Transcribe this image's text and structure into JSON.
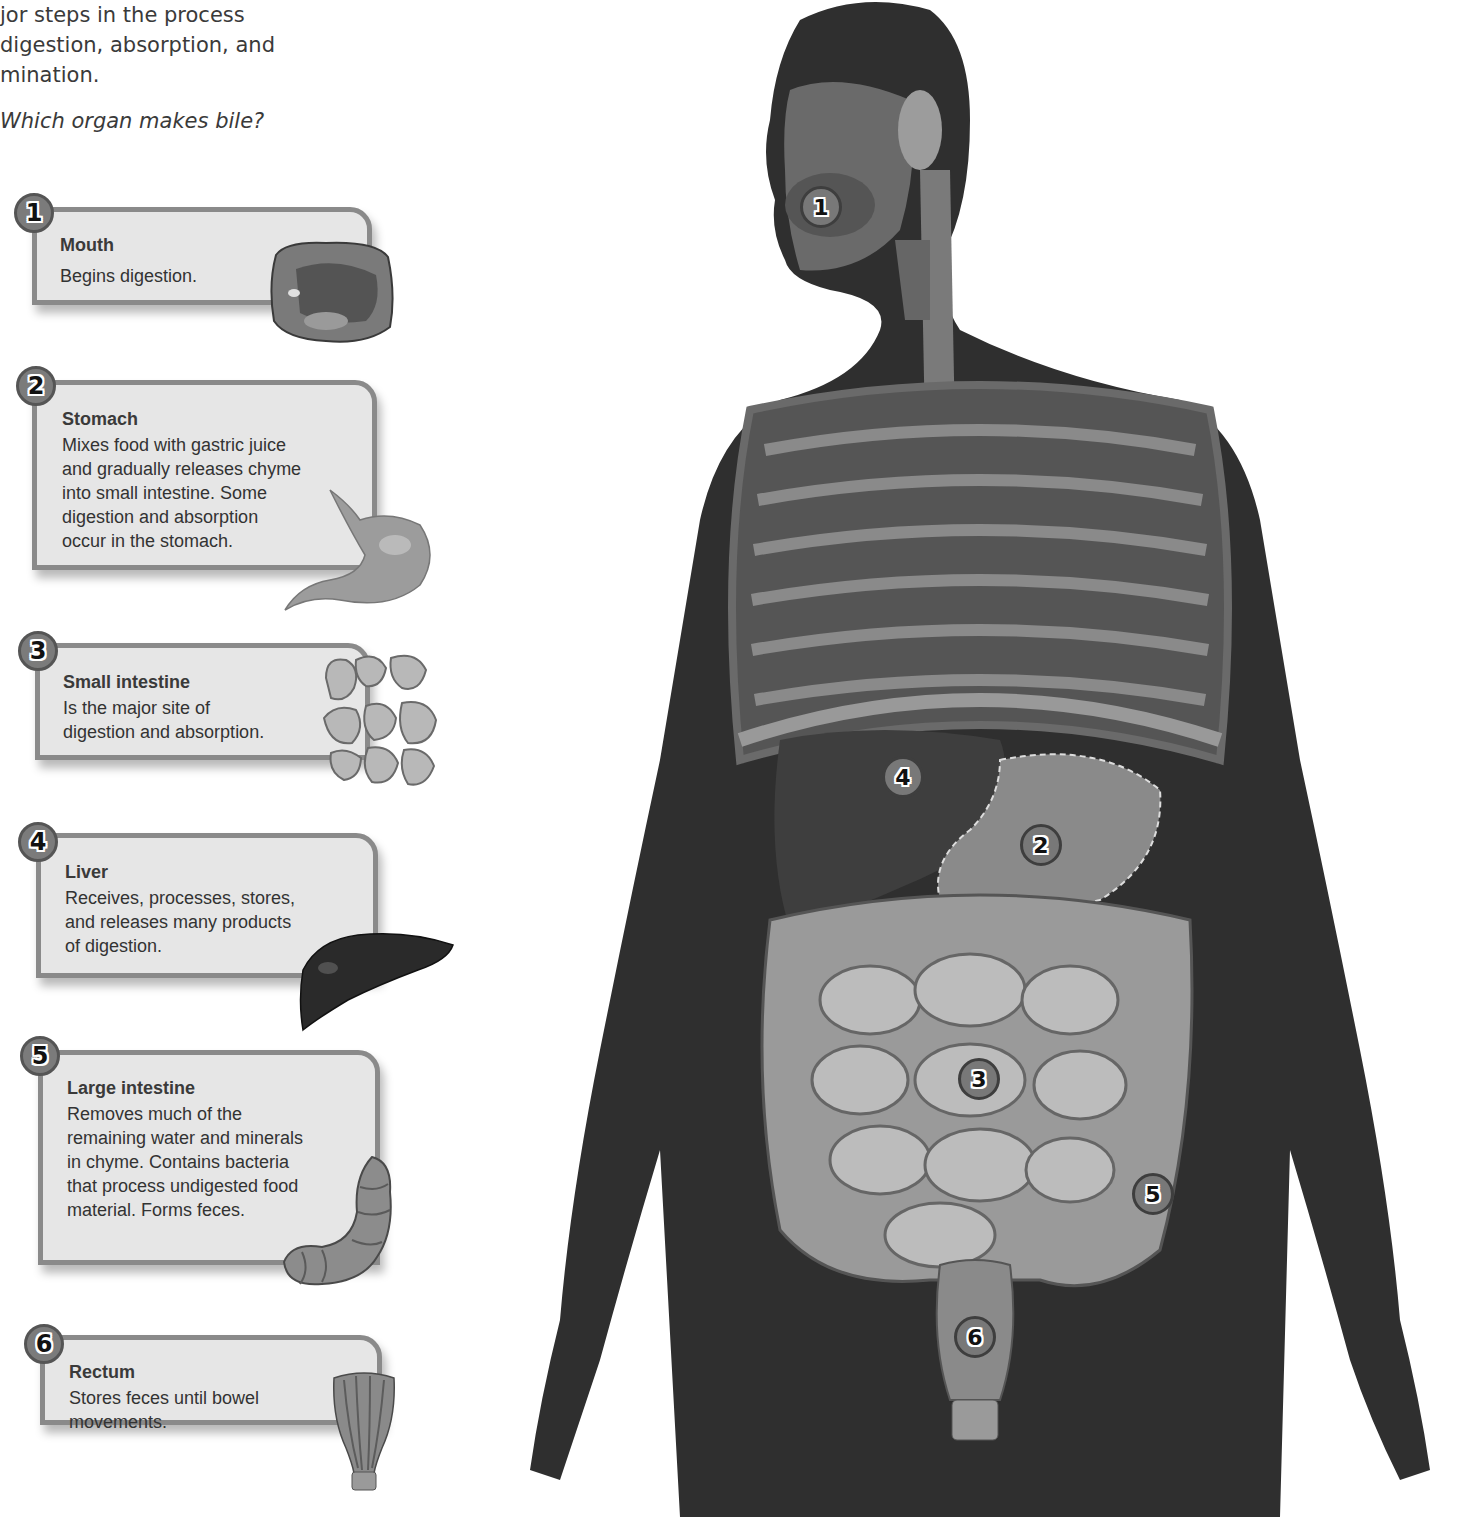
{
  "intro": {
    "lines": [
      "jor steps in the process",
      "digestion, absorption, and",
      "mination."
    ],
    "question": "Which organ makes bile?"
  },
  "steps": [
    {
      "number": "1",
      "title": "Mouth",
      "description": [
        "Begins digestion."
      ],
      "organ_icon": "mouth-cross-section"
    },
    {
      "number": "2",
      "title": "Stomach",
      "description": [
        "Mixes food with gastric juice",
        "and gradually releases chyme",
        "into small intestine. Some",
        "digestion and absorption",
        "occur in the stomach."
      ],
      "organ_icon": "stomach"
    },
    {
      "number": "3",
      "title": "Small intestine",
      "description": [
        "Is the major site of",
        "digestion and absorption."
      ],
      "organ_icon": "small-intestine"
    },
    {
      "number": "4",
      "title": "Liver",
      "description": [
        "Receives, processes, stores,",
        "and releases many products",
        "of digestion."
      ],
      "organ_icon": "liver"
    },
    {
      "number": "5",
      "title": "Large intestine",
      "description": [
        "Removes much of the",
        "remaining water and minerals",
        "in chyme. Contains bacteria",
        "that process undigested food",
        "material. Forms feces."
      ],
      "organ_icon": "large-intestine"
    },
    {
      "number": "6",
      "title": "Rectum",
      "description": [
        "Stores feces until bowel",
        "movements."
      ],
      "organ_icon": "rectum"
    }
  ],
  "figure_markers": [
    {
      "number": "1",
      "organ": "mouth"
    },
    {
      "number": "2",
      "organ": "stomach"
    },
    {
      "number": "3",
      "organ": "small intestine"
    },
    {
      "number": "4",
      "organ": "liver"
    },
    {
      "number": "5",
      "organ": "large intestine"
    },
    {
      "number": "6",
      "organ": "rectum"
    }
  ],
  "colors": {
    "card_fill": "#e6e6e6",
    "card_border": "#8a8a8a",
    "badge_fill": "#7b7b7b",
    "skin": "#2f2f2f",
    "organ_gray": "#9a9a9a"
  }
}
